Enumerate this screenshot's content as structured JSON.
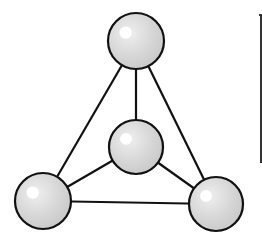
{
  "diagram": {
    "type": "tetrahedral-molecule",
    "colors": {
      "background": "#ffffff",
      "stroke": "#111111",
      "sphere_fill": "#d4d4d4",
      "sphere_highlight": "#ffffff"
    },
    "atoms": [
      {
        "id": "top",
        "cx": 136,
        "cy": 41,
        "r": 28
      },
      {
        "id": "center",
        "cx": 136,
        "cy": 147,
        "r": 27
      },
      {
        "id": "bottom-left",
        "cx": 43,
        "cy": 201,
        "r": 28
      },
      {
        "id": "bottom-right",
        "cx": 216,
        "cy": 204,
        "r": 27
      }
    ],
    "bonds": [
      {
        "from": "top",
        "to": "center"
      },
      {
        "from": "top",
        "to": "bottom-left"
      },
      {
        "from": "top",
        "to": "bottom-right"
      },
      {
        "from": "center",
        "to": "bottom-left"
      },
      {
        "from": "center",
        "to": "bottom-right"
      },
      {
        "from": "bottom-left",
        "to": "bottom-right"
      }
    ],
    "bracket": {
      "x": 261,
      "y1": 15,
      "y2": 163
    }
  }
}
